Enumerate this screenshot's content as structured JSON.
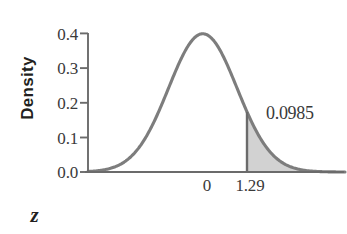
{
  "figure": {
    "background_color": "#ffffff",
    "curve_color": "#7d7d7d",
    "fill_color": "#d2d2d2",
    "axis_color": "#6b6b6b",
    "text_color": "#3a3a3a"
  },
  "axes": {
    "y_title": "Density",
    "x_title": "z",
    "y_ticks": [
      "0.4",
      "0.3",
      "0.2",
      "0.1",
      "0.0"
    ],
    "x_ticks": [
      "0",
      "1.29"
    ]
  },
  "annotations": {
    "area_label": "0.0985"
  },
  "chart_data": {
    "type": "area",
    "title": "",
    "xlabel": "z",
    "ylabel": "Density",
    "distribution": "standard normal",
    "mean": 0,
    "sd": 1,
    "xlim": [
      -3.35,
      4.15
    ],
    "ylim": [
      0.0,
      0.4
    ],
    "yticks": [
      0.0,
      0.1,
      0.2,
      0.3,
      0.4
    ],
    "ytick_labels": [
      "0.0",
      "0.1",
      "0.2",
      "0.3",
      "0.4"
    ],
    "xticks": [
      0,
      1.29
    ],
    "xtick_labels": [
      "0",
      "1.29"
    ],
    "grid": false,
    "legend": "none",
    "shaded_region": {
      "from": 1.29,
      "to": "infinity",
      "area": 0.0985,
      "label": "0.0985",
      "fill": "#d2d2d2"
    },
    "x": [
      -3.35,
      -3.0,
      -2.75,
      -2.5,
      -2.25,
      -2.0,
      -1.75,
      -1.5,
      -1.25,
      -1.0,
      -0.75,
      -0.5,
      -0.25,
      0,
      0.25,
      0.5,
      0.75,
      1.0,
      1.25,
      1.29,
      1.5,
      1.75,
      2.0,
      2.25,
      2.5,
      2.75,
      3.0,
      3.5,
      4.15
    ],
    "y": [
      0.0015,
      0.0044,
      0.0091,
      0.0175,
      0.0317,
      0.054,
      0.0863,
      0.1295,
      0.1826,
      0.242,
      0.3011,
      0.3521,
      0.3867,
      0.3989,
      0.3867,
      0.3521,
      0.3011,
      0.242,
      0.1826,
      0.1736,
      0.1295,
      0.0863,
      0.054,
      0.0317,
      0.0175,
      0.0091,
      0.0044,
      0.0009,
      0.0001
    ]
  }
}
